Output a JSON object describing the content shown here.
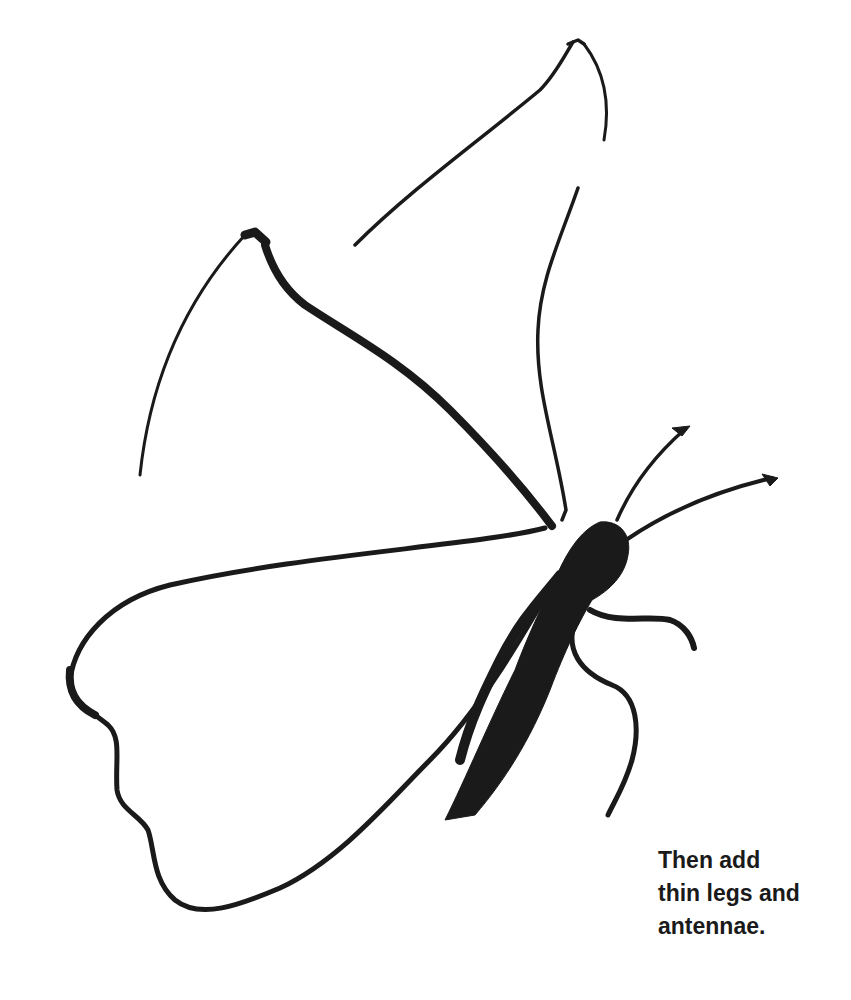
{
  "illustration": {
    "subject": "butterfly brush-ink drawing",
    "ink_color": "#1a1a1a",
    "paper_color": "#ffffff",
    "parts": [
      "upper-right-forewing",
      "upper-left-forewing",
      "lower-hindwing",
      "body",
      "antennae",
      "legs"
    ]
  },
  "caption": {
    "lines": [
      "Then add",
      "thin legs and",
      "antennae."
    ]
  }
}
